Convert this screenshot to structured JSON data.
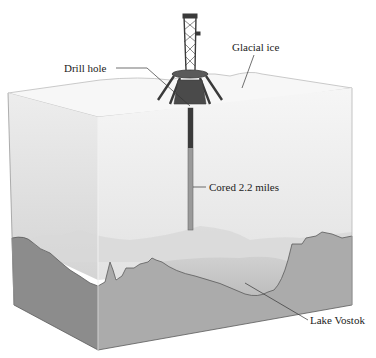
{
  "figure": {
    "labels": {
      "drill_hole": "Drill hole",
      "glacial_ice": "Glacial ice",
      "cored_depth": "Cored 2.2 miles",
      "lake": "Lake Vostok"
    },
    "colors": {
      "background": "#ffffff",
      "ice_top": "#f4f4f4",
      "ice_front": "#ececec",
      "ice_left": "#dedede",
      "rock_front": "#a9a9a9",
      "rock_left": "#8a8a8a",
      "lake_water": "#c4c4c4",
      "outline": "#555555",
      "drill_rig": "#3a3a3a",
      "label_text": "#222222",
      "leader_line": "#333333"
    }
  }
}
